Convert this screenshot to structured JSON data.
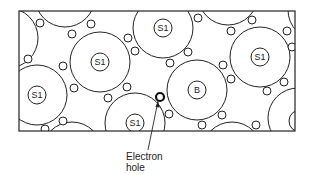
{
  "diagram": {
    "colors": {
      "line": "#222222",
      "background": "#ffffff"
    },
    "atoms": [
      {
        "label": "S1",
        "role": "silicon-atom"
      },
      {
        "label": "S1",
        "role": "silicon-atom"
      },
      {
        "label": "S1",
        "role": "silicon-atom"
      },
      {
        "label": "S1",
        "role": "silicon-atom"
      },
      {
        "label": "B",
        "role": "boron-atom"
      },
      {
        "label": "S1",
        "role": "silicon-atom"
      }
    ],
    "annotation": {
      "line1": "Electron",
      "line2": "hole"
    }
  }
}
